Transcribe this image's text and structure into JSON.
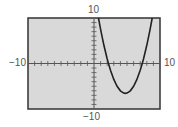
{
  "chart_data": {
    "type": "line",
    "title": "",
    "xlabel": "",
    "ylabel": "",
    "xlim": [
      -10,
      10
    ],
    "ylim": [
      -10,
      10
    ],
    "xscale_tick": 1,
    "yscale_tick": 1,
    "grid": false,
    "legend": null,
    "series": [
      {
        "name": "parabola",
        "x": [
          0.68,
          1,
          1.5,
          2,
          2.19,
          2.5,
          3,
          3.5,
          4,
          4.5,
          4.75,
          5,
          5.5,
          6,
          6.5,
          7,
          7.31,
          7.5,
          8,
          8.5,
          8.82
        ],
        "y": [
          10,
          7.5,
          4.0,
          1.0,
          0,
          -1.5,
          -3.5,
          -5.0,
          -6.0,
          -6.5,
          -6.56,
          -6.5,
          -6.0,
          -5.0,
          -3.5,
          -1.5,
          0,
          1.0,
          4.0,
          7.5,
          10
        ]
      }
    ],
    "annotations": {
      "x_intercepts_approx": [
        2.2,
        7.3
      ],
      "vertex_approx": [
        4.75,
        -6.6
      ]
    }
  },
  "labels": {
    "ymax": "10",
    "ymin": "−10",
    "xmin": "−10",
    "xmax": "10"
  },
  "colors": {
    "plot_bg": "#d9d9d9",
    "frame": "#333333",
    "axis": "#555555",
    "curve": "#222222",
    "label": "#555555"
  }
}
